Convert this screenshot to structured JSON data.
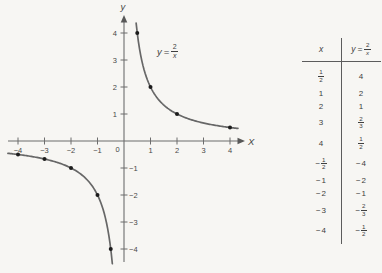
{
  "figure": {
    "equation_label": {
      "lhs": "y",
      "eq": "=",
      "num": "2",
      "den": "x"
    },
    "axes": {
      "x_label": "X",
      "y_label": "y",
      "origin_label": "0"
    }
  },
  "chart_data": {
    "type": "line",
    "formula": {
      "form": "y = k/x",
      "k": 2
    },
    "xlabel": "X",
    "ylabel": "y",
    "xlim": [
      -4.5,
      4.6
    ],
    "ylim": [
      -4.7,
      4.6
    ],
    "x_ticks": [
      -4,
      -3,
      -2,
      -1,
      1,
      2,
      3,
      4
    ],
    "y_ticks": [
      4,
      3,
      2,
      1,
      -1,
      -2,
      -3,
      -4
    ],
    "grid": false,
    "branches": [
      {
        "name": "first-quadrant",
        "x_from": 0.458,
        "x_to": 4.3
      },
      {
        "name": "third-quadrant",
        "x_from": -4.38,
        "x_to": -0.44
      }
    ],
    "marked_points": [
      {
        "x": 0.5,
        "y": 4
      },
      {
        "x": 1,
        "y": 2
      },
      {
        "x": 2,
        "y": 1
      },
      {
        "x": 4,
        "y": 0.5
      },
      {
        "x": -4,
        "y": -0.5
      },
      {
        "x": -3,
        "y": -0.6667
      },
      {
        "x": -2,
        "y": -1
      },
      {
        "x": -1,
        "y": -2
      },
      {
        "x": -0.5,
        "y": -4
      }
    ]
  },
  "table": {
    "header": {
      "x": "x",
      "y_lhs": "y",
      "y_eq": "=",
      "y_num": "2",
      "y_den": "x"
    },
    "rows": [
      {
        "x": "1/2",
        "y": "4"
      },
      {
        "x": "1",
        "y": "2"
      },
      {
        "x": "2",
        "y": "1"
      },
      {
        "x": "3",
        "y": "2/3"
      },
      {
        "x": "4",
        "y": "1/2"
      },
      {
        "x": "−1/2",
        "y": "−4"
      },
      {
        "x": "−1",
        "y": "−2"
      },
      {
        "x": "−2",
        "y": "−1"
      },
      {
        "x": "−3",
        "y": "−2/3"
      },
      {
        "x": "−4",
        "y": "−1/2"
      }
    ]
  }
}
